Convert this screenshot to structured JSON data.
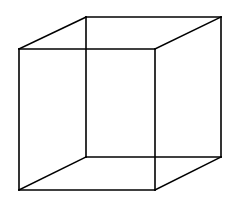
{
  "diagram": {
    "type": "necker-cube",
    "stroke_color": "#000000",
    "background": "#ffffff",
    "stroke_width": 1.6,
    "vertices": {
      "front_top_left": [
        19,
        49
      ],
      "front_top_right": [
        155,
        49
      ],
      "front_bottom_left": [
        19,
        190
      ],
      "front_bottom_right": [
        155,
        190
      ],
      "back_top_left": [
        86,
        17
      ],
      "back_top_right": [
        221,
        17
      ],
      "back_bottom_left": [
        86,
        157
      ],
      "back_bottom_right": [
        221,
        157
      ]
    },
    "edges": [
      [
        "front_top_left",
        "front_top_right"
      ],
      [
        "front_top_right",
        "front_bottom_right"
      ],
      [
        "front_bottom_right",
        "front_bottom_left"
      ],
      [
        "front_bottom_left",
        "front_top_left"
      ],
      [
        "back_top_left",
        "back_top_right"
      ],
      [
        "back_top_right",
        "back_bottom_right"
      ],
      [
        "back_bottom_right",
        "back_bottom_left"
      ],
      [
        "back_bottom_left",
        "back_top_left"
      ],
      [
        "front_top_left",
        "back_top_left"
      ],
      [
        "front_top_right",
        "back_top_right"
      ],
      [
        "front_bottom_left",
        "back_bottom_left"
      ],
      [
        "front_bottom_right",
        "back_bottom_right"
      ]
    ]
  }
}
